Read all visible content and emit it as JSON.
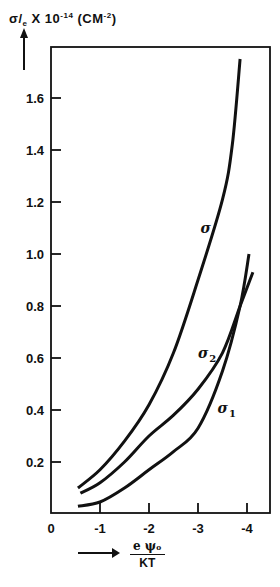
{
  "chart_data": {
    "type": "line",
    "title": "",
    "ylabel": "σ/e × 10^-14 (CM^-2)",
    "ylabel_parts": {
      "main": "σ/",
      "sub": "e",
      "times": " X 10",
      "exp": "-14",
      "unit_open": " (CM",
      "unit_exp": "-2",
      "unit_close": ")"
    },
    "xlabel": "eψ₀ / KT",
    "xlabel_parts": {
      "numerator": "e ψₒ",
      "denominator": "KT"
    },
    "xlim": [
      0,
      -4.5
    ],
    "ylim": [
      0,
      1.8
    ],
    "x_ticks": [
      {
        "value": 0,
        "label": "0"
      },
      {
        "value": -1,
        "label": "-1"
      },
      {
        "value": -2,
        "label": "-2"
      },
      {
        "value": -3,
        "label": "-3"
      },
      {
        "value": -4,
        "label": "-4"
      }
    ],
    "y_ticks": [
      {
        "value": 0.2,
        "label": "0.2"
      },
      {
        "value": 0.4,
        "label": "0.4"
      },
      {
        "value": 0.6,
        "label": "0.6"
      },
      {
        "value": 0.8,
        "label": "0.8"
      },
      {
        "value": 1.0,
        "label": "1.0"
      },
      {
        "value": 1.2,
        "label": "1.2"
      },
      {
        "value": 1.4,
        "label": "1.4"
      },
      {
        "value": 1.6,
        "label": "1.6"
      }
    ],
    "grid": false,
    "legend": "inline labels",
    "series": [
      {
        "name": "σ",
        "label": "σ",
        "label_sub": "",
        "label_pos": [
          -3.05,
          1.08
        ],
        "x": [
          -0.55,
          -1.0,
          -1.5,
          -2.0,
          -2.5,
          -3.0,
          -3.5,
          -3.7,
          -3.86
        ],
        "y": [
          0.1,
          0.17,
          0.28,
          0.42,
          0.62,
          0.9,
          1.21,
          1.42,
          1.75
        ]
      },
      {
        "name": "σ2",
        "label": "σ",
        "label_sub": "2",
        "label_pos": [
          -3.0,
          0.6
        ],
        "x": [
          -0.6,
          -1.0,
          -1.5,
          -2.0,
          -2.5,
          -3.0,
          -3.5,
          -3.86,
          -4.12
        ],
        "y": [
          0.08,
          0.12,
          0.2,
          0.3,
          0.38,
          0.48,
          0.62,
          0.8,
          0.93
        ]
      },
      {
        "name": "σ1",
        "label": "σ",
        "label_sub": "1",
        "label_pos": [
          -3.4,
          0.39
        ],
        "x": [
          -0.55,
          -1.0,
          -1.5,
          -2.0,
          -2.5,
          -3.0,
          -3.5,
          -3.86,
          -4.04
        ],
        "y": [
          0.03,
          0.046,
          0.1,
          0.17,
          0.24,
          0.33,
          0.55,
          0.8,
          1.0
        ]
      }
    ]
  },
  "colors": {
    "ink": "#111111",
    "background": "#ffffff"
  }
}
